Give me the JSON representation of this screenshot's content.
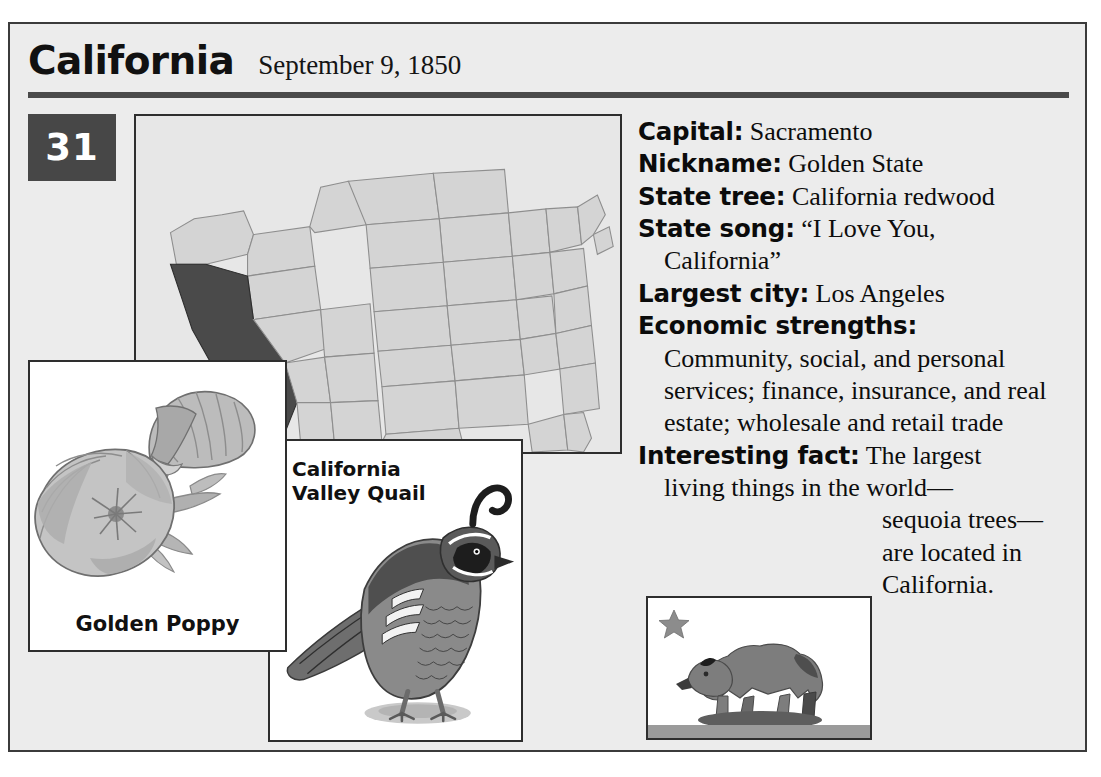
{
  "card": {
    "state_name": "California",
    "statehood_date": "September 9, 1850",
    "order_number": "31"
  },
  "facts": [
    {
      "label": "Capital:",
      "value": "Sacramento"
    },
    {
      "label": "Nickname:",
      "value": "Golden State"
    },
    {
      "label": "State tree:",
      "value": "California redwood"
    },
    {
      "label": "State song:",
      "value": "“I Love You,",
      "value_cont": "California”"
    },
    {
      "label": "Largest city:",
      "value": "Los Angeles"
    },
    {
      "label": "Economic strengths:",
      "value": ""
    },
    {
      "label": "Interesting fact:",
      "value": "The largest"
    }
  ],
  "economic_strengths": {
    "label": "Economic strengths:",
    "body": "Community, social, and personal services; finance, insurance, and real estate; wholesale and retail trade"
  },
  "interesting_fact": {
    "label": "Interesting fact:",
    "line1": "The largest",
    "line2": "living things in the world—",
    "tail": "sequoia trees— are located in California."
  },
  "panels": {
    "map": {
      "caption": "",
      "icon": "us-map-icon",
      "highlighted_state": "California",
      "highlight_color": "#4a4a4a",
      "base_color": "#d6d6d6"
    },
    "poppy": {
      "caption": "Golden Poppy",
      "icon": "poppy-flower-icon"
    },
    "quail": {
      "caption_line1": "California",
      "caption_line2": "Valley Quail",
      "icon": "quail-bird-icon"
    },
    "flag": {
      "motto": "CALIFORNIA REPUBLIC",
      "icon": "california-flag-icon",
      "star_color": "#8c8c8c",
      "bear_color": "#7d7d7d",
      "stripe_color": "#9b9b9b"
    }
  },
  "colors": {
    "background": "#ececec",
    "frame": "#3b3b3b",
    "rule": "#4a4a4a",
    "badge_bg": "#474747",
    "badge_text": "#ffffff",
    "text": "#0d0d0d"
  }
}
